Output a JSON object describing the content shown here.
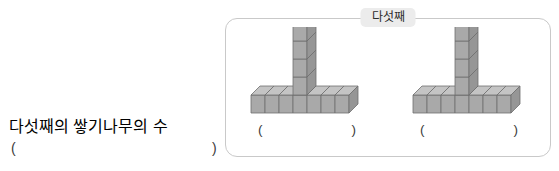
{
  "question": {
    "label": "다섯째의 쌓기나무의 수",
    "answer_paren_open": "(",
    "answer_paren_close": ")"
  },
  "panel": {
    "title": "다섯째",
    "border_color": "#c9c9c9",
    "title_background": "#ececec"
  },
  "figures": [
    {
      "name": "block-figure-left",
      "answer_paren_open": "(",
      "answer_paren_close": ")"
    },
    {
      "name": "block-figure-right",
      "answer_paren_open": "(",
      "answer_paren_close": ")"
    }
  ],
  "block_figure": {
    "shape": "T-shape",
    "base_row_cubes": 7,
    "base_cubes_left_of_column": 3,
    "base_cubes_right_of_column": 3,
    "column_cubes_above_base": 4,
    "total_cubes": 10,
    "cube_face_color": "#a9a9a9",
    "cube_top_color": "#c4c4c4",
    "cube_side_color": "#969696",
    "cube_edge_color": "#6f6f6f"
  }
}
